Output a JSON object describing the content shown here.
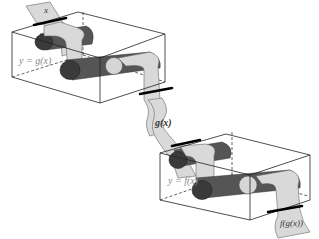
{
  "diagram": {
    "colors": {
      "background": "#ffffff",
      "tape": "#d9d9d9",
      "roller": "#555555",
      "roller_end_dark": "#3a3a3a",
      "roller_end_light": "#d6d6d6",
      "box_edge": "#222222",
      "box_label": "#8a8a8a"
    },
    "labels": {
      "input": "x",
      "top_box": "y = g(x)",
      "middle_tape": "g(x)",
      "bottom_box": "y = f(x)",
      "output": "f(g(x))"
    },
    "boxes": [
      {
        "id": "top",
        "function_label": "y = g(x)"
      },
      {
        "id": "bottom",
        "function_label": "y = f(x)"
      }
    ],
    "tapes": [
      {
        "id": "input-tape",
        "label": "x"
      },
      {
        "id": "intermediate-tape",
        "label": "g(x)"
      },
      {
        "id": "output-tape",
        "label": "f(g(x))"
      }
    ]
  }
}
